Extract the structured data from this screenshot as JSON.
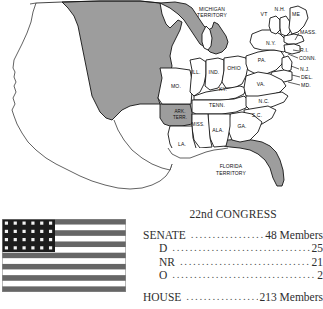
{
  "map": {
    "title": "United States map 1831",
    "state_labels": [
      {
        "id": "michigan-territory",
        "text": "MICHIGAN",
        "x": 212,
        "y": 11,
        "anchor": "middle",
        "size": "terrlbl"
      },
      {
        "id": "michigan-territory2",
        "text": "TERRITORY",
        "x": 212,
        "y": 17,
        "anchor": "middle",
        "size": "terrlbl"
      },
      {
        "id": "vermont",
        "text": "VT",
        "x": 264,
        "y": 16,
        "anchor": "middle",
        "size": "norm"
      },
      {
        "id": "new-hampshire",
        "text": "N.H.",
        "x": 280,
        "y": 11,
        "anchor": "middle",
        "size": "norm"
      },
      {
        "id": "maine",
        "text": "ME",
        "x": 296,
        "y": 16,
        "anchor": "middle",
        "size": "norm"
      },
      {
        "id": "massachusetts",
        "text": "MASS.",
        "x": 300,
        "y": 34,
        "anchor": "start",
        "size": "norm"
      },
      {
        "id": "new-york",
        "text": "N.Y.",
        "x": 271,
        "y": 45,
        "anchor": "middle",
        "size": "norm"
      },
      {
        "id": "rhode-island",
        "text": "R.I.",
        "x": 300,
        "y": 52,
        "anchor": "start",
        "size": "norm"
      },
      {
        "id": "connecticut",
        "text": "CONN.",
        "x": 299,
        "y": 60,
        "anchor": "start",
        "size": "norm"
      },
      {
        "id": "new-jersey",
        "text": "N.J.",
        "x": 300,
        "y": 71,
        "anchor": "start",
        "size": "norm"
      },
      {
        "id": "delaware",
        "text": "DEL.",
        "x": 301,
        "y": 79,
        "anchor": "start",
        "size": "norm"
      },
      {
        "id": "maryland",
        "text": "MD.",
        "x": 301,
        "y": 87,
        "anchor": "start",
        "size": "norm"
      },
      {
        "id": "pennsylvania",
        "text": "PA.",
        "x": 262,
        "y": 62,
        "anchor": "middle",
        "size": "norm"
      },
      {
        "id": "ohio",
        "text": "OHIO",
        "x": 234,
        "y": 70,
        "anchor": "middle",
        "size": "norm"
      },
      {
        "id": "indiana",
        "text": "IND.",
        "x": 214,
        "y": 74,
        "anchor": "middle",
        "size": "norm"
      },
      {
        "id": "illinois",
        "text": "ILL.",
        "x": 196,
        "y": 74,
        "anchor": "middle",
        "size": "norm"
      },
      {
        "id": "missouri",
        "text": "MO.",
        "x": 176,
        "y": 88,
        "anchor": "middle",
        "size": "norm"
      },
      {
        "id": "kentucky",
        "text": "KY.",
        "x": 223,
        "y": 91,
        "anchor": "middle",
        "size": "norm"
      },
      {
        "id": "virginia",
        "text": "VA.",
        "x": 261,
        "y": 86,
        "anchor": "middle",
        "size": "norm"
      },
      {
        "id": "tennessee",
        "text": "TENN.",
        "x": 217,
        "y": 107,
        "anchor": "middle",
        "size": "norm"
      },
      {
        "id": "north-carolina",
        "text": "N.C.",
        "x": 264,
        "y": 103,
        "anchor": "middle",
        "size": "norm"
      },
      {
        "id": "south-carolina",
        "text": "S.C.",
        "x": 257,
        "y": 117,
        "anchor": "middle",
        "size": "norm"
      },
      {
        "id": "arkansas-territory",
        "text": "ARK.",
        "x": 180,
        "y": 113,
        "anchor": "middle",
        "size": "tiny"
      },
      {
        "id": "arkansas-territory2",
        "text": "TERR.",
        "x": 180,
        "y": 119,
        "anchor": "middle",
        "size": "tiny"
      },
      {
        "id": "mississippi",
        "text": "MISS.",
        "x": 198,
        "y": 126,
        "anchor": "middle",
        "size": "tiny"
      },
      {
        "id": "alabama",
        "text": "ALA.",
        "x": 218,
        "y": 132,
        "anchor": "middle",
        "size": "norm"
      },
      {
        "id": "georgia",
        "text": "GA.",
        "x": 242,
        "y": 128,
        "anchor": "middle",
        "size": "norm"
      },
      {
        "id": "louisiana",
        "text": "LA.",
        "x": 182,
        "y": 146,
        "anchor": "middle",
        "size": "norm"
      },
      {
        "id": "florida-territory",
        "text": "FLORIDA",
        "x": 231,
        "y": 168,
        "anchor": "middle",
        "size": "terrlbl"
      },
      {
        "id": "florida-territory2",
        "text": "TERRITORY",
        "x": 231,
        "y": 175,
        "anchor": "middle",
        "size": "terrlbl"
      }
    ]
  },
  "flag": {
    "name": "24-star United States flag",
    "star_rows": 4,
    "star_columns": 6,
    "star_count": 24,
    "stripe_count": 13,
    "canton_color": "#1c1c1c",
    "stripe_color": "#666666"
  },
  "legend": {
    "title": "22nd CONGRESS",
    "rows": [
      {
        "label": "SENATE",
        "value": "48 Members",
        "indented": false,
        "gap": false
      },
      {
        "label": "D",
        "value": "25",
        "indented": true,
        "gap": false
      },
      {
        "label": "NR",
        "value": "21",
        "indented": true,
        "gap": false
      },
      {
        "label": "O",
        "value": "2",
        "indented": true,
        "gap": false
      },
      {
        "label": "HOUSE",
        "value": "213 Members",
        "indented": false,
        "gap": true
      }
    ]
  }
}
